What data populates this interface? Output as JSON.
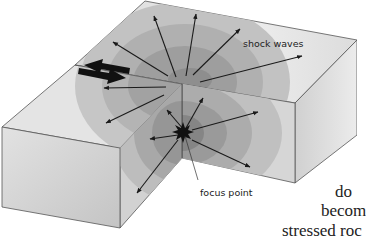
{
  "figure": {
    "labels": {
      "shock_waves": "shock waves",
      "focus_point": "focus point"
    }
  },
  "body_text": {
    "line1": "do",
    "line2": "becom",
    "line3": "stressed roc"
  },
  "colors": {
    "background": "#ffffff",
    "block_light": "#e6e6e6",
    "block_mid": "#c8c8c8",
    "wave_ring_1": "#b0b0b0",
    "wave_ring_2": "#9a9a9a",
    "wave_ring_3": "#878787",
    "arrow": "#1a1a1a"
  }
}
